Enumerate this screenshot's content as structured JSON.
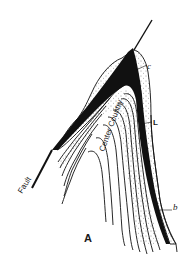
{
  "figure": {
    "panel_label": "A",
    "labels": {
      "c": "c",
      "L": "L",
      "b": "b",
      "fault": "Fault",
      "center_country": "Center Country"
    }
  },
  "colors": {
    "ink": "#111111",
    "background": "#ffffff",
    "stipple": "#333333"
  }
}
